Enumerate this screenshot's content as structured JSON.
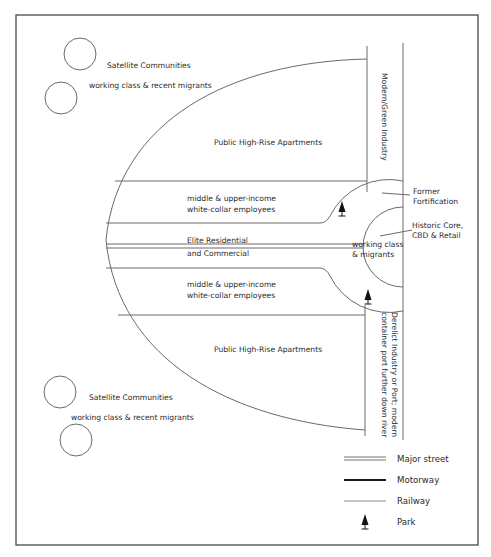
{
  "diagram": {
    "type": "urban-structure-model",
    "zones": {
      "satellite_top": {
        "title": "Satellite Communities",
        "subtitle": "working class & recent migrants"
      },
      "satellite_bottom": {
        "title": "Satellite Communities",
        "subtitle": "working class & recent migrants"
      },
      "public_top": "Public High-Rise Apartments",
      "public_bottom": "Public High-Rise Apartments",
      "middle_top": {
        "line1": "middle & upper-income",
        "line2": "white-collar employees"
      },
      "middle_bottom": {
        "line1": "middle & upper-income",
        "line2": "white-collar employees"
      },
      "elite": {
        "line1": "Elite Residential",
        "line2": "and Commercial"
      },
      "core_inner": {
        "line1": "working class",
        "line2": "& migrants"
      },
      "industry_top": "Modern/Green Industry",
      "industry_bottom": {
        "line1": "Derelict Industry or Port; modern",
        "line2": "container port further down river"
      }
    },
    "callouts": {
      "fortification": {
        "line1": "Former",
        "line2": "Fortification"
      },
      "historic_core": {
        "line1": "Historic Core,",
        "line2": "CBD & Retail"
      }
    },
    "legend": {
      "items": [
        {
          "symbol": "major-street",
          "label": "Major street"
        },
        {
          "symbol": "motorway",
          "label": "Motorway"
        },
        {
          "symbol": "railway",
          "label": "Railway"
        },
        {
          "symbol": "park",
          "label": "Park"
        }
      ]
    },
    "colors": {
      "line": "#6a6a6a",
      "frame": "#555555",
      "text": "#2a2a2a",
      "motorway": "#1a1a1a"
    }
  }
}
